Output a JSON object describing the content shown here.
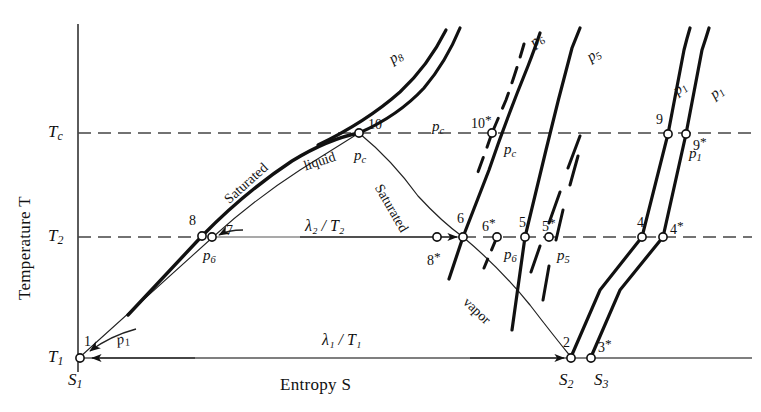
{
  "figure": {
    "type": "thermodynamic-temperature-entropy-diagram",
    "width": 761,
    "height": 412,
    "background": "#ffffff",
    "ink": "#111111"
  },
  "axes": {
    "x_label": "Entropy S",
    "y_label": "Temperature T",
    "y_ticks": [
      {
        "id": "Tc",
        "base": "T",
        "sub": "c",
        "y_px": 133
      },
      {
        "id": "T2",
        "base": "T",
        "sub": "2",
        "y_px": 237
      },
      {
        "id": "T1",
        "base": "T",
        "sub": "1",
        "y_px": 358
      }
    ],
    "x_ticks": [
      {
        "id": "S1",
        "base": "S",
        "sub": "1",
        "x_px": 80
      },
      {
        "id": "S2",
        "base": "S",
        "sub": "2",
        "x_px": 571
      },
      {
        "id": "S3",
        "base": "S",
        "sub": "3",
        "x_px": 591
      }
    ],
    "origin_px": {
      "x": 78,
      "y": 358
    }
  },
  "isotherms": {
    "Tc_dashed": true,
    "T2_dashed": true,
    "T1_solid": true
  },
  "region_labels": [
    {
      "name": "saturated-liquid",
      "text": "Saturated",
      "x": 222,
      "y": 196,
      "rotate": -42
    },
    {
      "name": "saturated-liquid-word2",
      "text": "liquid",
      "x": 302,
      "y": 160,
      "rotate": -18
    },
    {
      "name": "saturated-vapor",
      "text": "Saturated",
      "x": 384,
      "y": 182,
      "rotate": 60
    },
    {
      "name": "saturated-vapor-word2",
      "text": "vapor",
      "x": 470,
      "y": 295,
      "rotate": 44
    }
  ],
  "heat_labels": [
    {
      "name": "lambda2-over-T2",
      "text": "λ₂ / T₂",
      "x": 305,
      "y": 218
    },
    {
      "name": "lambda1-over-T1",
      "text": "λ₁ / T₁",
      "x": 322,
      "y": 332
    }
  ],
  "pressure_labels": [
    {
      "name": "p8-label",
      "base": "p",
      "sub": "8",
      "x": 386,
      "y": 54,
      "rotate": -34
    },
    {
      "name": "pc-upper-label",
      "base": "p",
      "sub": "c",
      "x": 432,
      "y": 119,
      "rotate": 0
    },
    {
      "name": "pc-critical-label",
      "base": "p",
      "sub": "c",
      "x": 354,
      "y": 148,
      "rotate": 0
    },
    {
      "name": "pc-star-label",
      "base": "p",
      "sub": "c",
      "x": 504,
      "y": 142,
      "rotate": 0
    },
    {
      "name": "p6-upper-label",
      "base": "p",
      "sub": "6",
      "x": 527,
      "y": 38,
      "rotate": -38
    },
    {
      "name": "p6-at-7-label",
      "base": "p",
      "sub": "6",
      "x": 203,
      "y": 248,
      "rotate": 0
    },
    {
      "name": "p6-at-6star-label",
      "base": "p",
      "sub": "6",
      "x": 504,
      "y": 247,
      "rotate": 0
    },
    {
      "name": "p5-upper-label",
      "base": "p",
      "sub": "5",
      "x": 584,
      "y": 52,
      "rotate": -34
    },
    {
      "name": "p5-at-5star-label",
      "base": "p",
      "sub": "5",
      "x": 557,
      "y": 248,
      "rotate": 0
    },
    {
      "name": "p1-upper-label",
      "base": "p",
      "sub": "1",
      "x": 670,
      "y": 86,
      "rotate": -38
    },
    {
      "name": "p1-outer-label",
      "base": "p",
      "sub": "1",
      "x": 707,
      "y": 90,
      "rotate": -38
    },
    {
      "name": "p1-at-9star-label",
      "base": "p",
      "sub": "1",
      "x": 689,
      "y": 146,
      "rotate": 0
    },
    {
      "name": "p1-at-1-label",
      "base": "p",
      "sub": "1",
      "x": 115,
      "y": 333,
      "rotate": -12
    }
  ],
  "state_points": [
    {
      "id": "1",
      "label": "1",
      "star": false,
      "x": 80,
      "y": 358,
      "lx": 84,
      "ly": 335
    },
    {
      "id": "2",
      "label": "2",
      "star": false,
      "x": 571,
      "y": 358,
      "lx": 563,
      "ly": 336
    },
    {
      "id": "3*",
      "label": "3",
      "star": true,
      "x": 591,
      "y": 358,
      "lx": 598,
      "ly": 337
    },
    {
      "id": "4",
      "label": "4",
      "star": false,
      "x": 642,
      "y": 237,
      "lx": 637,
      "ly": 216
    },
    {
      "id": "4*",
      "label": "4",
      "star": true,
      "x": 663,
      "y": 237,
      "lx": 670,
      "ly": 219
    },
    {
      "id": "5",
      "label": "5",
      "star": false,
      "x": 525,
      "y": 237,
      "lx": 519,
      "ly": 216
    },
    {
      "id": "5*",
      "label": "5",
      "star": true,
      "x": 549,
      "y": 237,
      "lx": 542,
      "ly": 216
    },
    {
      "id": "6",
      "label": "6",
      "star": false,
      "x": 463,
      "y": 237,
      "lx": 457,
      "ly": 212
    },
    {
      "id": "6*",
      "label": "6",
      "star": true,
      "x": 497,
      "y": 237,
      "lx": 482,
      "ly": 216
    },
    {
      "id": "7",
      "label": "7",
      "star": false,
      "x": 212,
      "y": 237,
      "lx": 226,
      "ly": 224
    },
    {
      "id": "8",
      "label": "8",
      "star": false,
      "x": 202,
      "y": 236,
      "lx": 189,
      "ly": 214
    },
    {
      "id": "8*",
      "label": "8",
      "star": true,
      "x": 437,
      "y": 237,
      "lx": 427,
      "ly": 250
    },
    {
      "id": "9",
      "label": "9",
      "star": false,
      "x": 668,
      "y": 134,
      "lx": 656,
      "ly": 113
    },
    {
      "id": "9*",
      "label": "9",
      "star": true,
      "x": 686,
      "y": 134,
      "lx": 693,
      "ly": 135
    },
    {
      "id": "10",
      "label": "10",
      "star": false,
      "x": 359,
      "y": 133,
      "lx": 368,
      "ly": 118
    },
    {
      "id": "10*",
      "label": "10",
      "star": true,
      "x": 492,
      "y": 133,
      "lx": 471,
      "ly": 113
    }
  ],
  "arrows": [
    {
      "name": "arrow-to-1-horizontal",
      "from": [
        195,
        358
      ],
      "to": [
        88,
        358
      ]
    },
    {
      "name": "arrow-to-2-horizontal",
      "from": [
        470,
        358
      ],
      "to": [
        566,
        358
      ]
    },
    {
      "name": "arrow-to-6-horizontal",
      "from": [
        300,
        237
      ],
      "to": [
        459,
        237
      ]
    },
    {
      "name": "arrow-to-7-curved",
      "from": [
        240,
        231
      ],
      "to": [
        217,
        236
      ]
    },
    {
      "name": "arrow-to-1-curved",
      "from": [
        135,
        330
      ],
      "to": [
        86,
        352
      ]
    }
  ],
  "curves": {
    "dome_liquid_side": "critical dome left branch from point 1 through 8 to critical point 10",
    "dome_vapor_side": "critical dome right branch from critical point 10 through 6 down to point 2",
    "isobar_p8": "steep near-vertical isobar above critical point",
    "isobar_pc": "critical isobar through point 10",
    "isobars_right": [
      "p_c*",
      "p_6",
      "p_5",
      "p_1",
      "p_1 outer"
    ]
  }
}
